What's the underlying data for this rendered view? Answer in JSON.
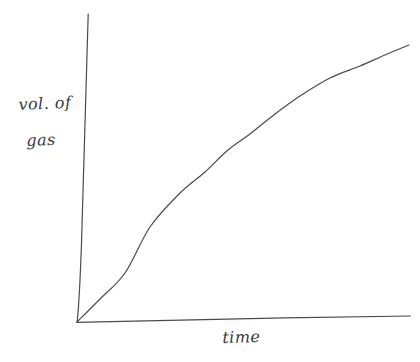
{
  "figure": {
    "kind": "hand-drawn-sketch",
    "background_color": "#ffffff",
    "ink_color": "#4a4a4d",
    "stroke_width": 1.2
  },
  "axes": {
    "y_axis": {
      "label_line1": "vol. of",
      "label_line2": "gas",
      "has_ticks": false,
      "has_tick_labels": false,
      "top_point": [
        88,
        14
      ],
      "bottom_point": [
        77,
        322
      ]
    },
    "x_axis": {
      "label": "time",
      "has_ticks": false,
      "has_tick_labels": false,
      "left_point": [
        77,
        322
      ],
      "right_point": [
        410,
        316
      ]
    }
  },
  "chart_data": {
    "type": "line",
    "title": "",
    "subtitle": "",
    "xlabel": "time",
    "ylabel": "vol. of gas",
    "grid": false,
    "legend": false,
    "legend_position": "none",
    "axis_tick_labels": {
      "x": [],
      "y": []
    },
    "xlim": [
      0,
      1
    ],
    "ylim": [
      0,
      1
    ],
    "annotations": [],
    "series": [
      {
        "name": "volume of gas",
        "x": [
          0.0,
          0.05,
          0.1,
          0.15,
          0.2,
          0.25,
          0.3,
          0.35,
          0.4,
          0.45,
          0.5,
          0.55,
          0.6,
          0.65,
          0.7,
          0.75,
          0.8,
          0.85,
          0.9,
          0.95,
          1.0
        ],
        "y": [
          0.0,
          0.07,
          0.14,
          0.2,
          0.27,
          0.33,
          0.39,
          0.44,
          0.5,
          0.55,
          0.6,
          0.64,
          0.68,
          0.72,
          0.76,
          0.79,
          0.82,
          0.85,
          0.87,
          0.89,
          0.9
        ]
      }
    ],
    "pixel_path_points": [
      [
        77,
        322
      ],
      [
        100,
        299
      ],
      [
        125,
        273
      ],
      [
        150,
        227
      ],
      [
        180,
        193
      ],
      [
        205,
        172
      ],
      [
        228,
        150
      ],
      [
        250,
        134
      ],
      [
        275,
        114
      ],
      [
        300,
        96
      ],
      [
        330,
        78
      ],
      [
        360,
        66
      ],
      [
        385,
        55
      ],
      [
        409,
        45
      ]
    ]
  }
}
